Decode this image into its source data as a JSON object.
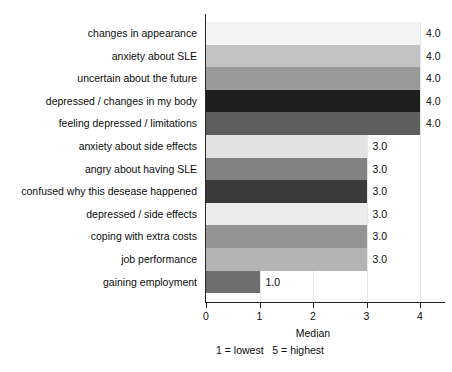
{
  "chart_data": {
    "type": "bar",
    "orientation": "horizontal",
    "title": "",
    "xlabel": "Median",
    "ylabel": "",
    "xlim": [
      0,
      4
    ],
    "xticks": [
      "0",
      "1",
      "2",
      "3",
      "4"
    ],
    "grid": true,
    "legend": "none",
    "footnote": "1 = lowest   5 = highest",
    "categories": [
      "changes in appearance",
      "anxiety about SLE",
      "uncertain about the future",
      "depressed / changes in my body",
      "feeling depressed / limitations",
      "anxiety about side effects",
      "angry about having SLE",
      "confused why this desease happened",
      "depressed / side effects",
      "coping with extra costs",
      "job performance",
      "gaining employment"
    ],
    "values": [
      4.0,
      4.0,
      4.0,
      4.0,
      4.0,
      3.0,
      3.0,
      3.0,
      3.0,
      3.0,
      3.0,
      1.0
    ],
    "value_labels": [
      "4.0",
      "4.0",
      "4.0",
      "4.0",
      "4.0",
      "3.0",
      "3.0",
      "3.0",
      "3.0",
      "3.0",
      "3.0",
      "1.0"
    ],
    "bar_colors": [
      "#f4f4f4",
      "#c2c2c2",
      "#9a9a9a",
      "#1e1e1e",
      "#5e5e5e",
      "#e2e2e2",
      "#828282",
      "#3a3a3a",
      "#ececec",
      "#949494",
      "#b4b4b4",
      "#6e6e6e"
    ]
  }
}
